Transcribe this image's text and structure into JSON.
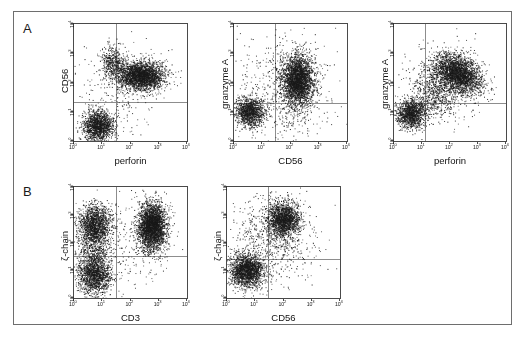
{
  "figure": {
    "panel_letters": [
      "A",
      "B"
    ],
    "tick_labels": [
      "10",
      "10",
      "10",
      "10",
      "10"
    ],
    "tick_exponents": [
      "0",
      "1",
      "2",
      "3",
      "4"
    ],
    "axis_decades": 4,
    "colors": {
      "dot": "#1a1a1a",
      "frame": "#4a4a4a",
      "quadrant": "#8d8d8d",
      "outer_border": "#6e6e6e",
      "background": "#ffffff"
    }
  },
  "chart_data": [
    {
      "type": "scatter",
      "panel": "A1",
      "title": "",
      "xlabel": "perforin",
      "ylabel": "CD56",
      "xlim": [
        0,
        4
      ],
      "ylim": [
        0,
        4
      ],
      "xticks": [
        0,
        1,
        2,
        3,
        4
      ],
      "yticks": [
        0,
        1,
        2,
        3,
        4
      ],
      "grid": false,
      "legend": "none",
      "quadrant_x": 1.5,
      "quadrant_y": 1.35,
      "populations": [
        {
          "name": "CD56+ perforin+ (double positive)",
          "cx": 2.35,
          "cy": 2.25,
          "sx": 0.42,
          "sy": 0.24,
          "n": 2600,
          "rot": 0
        },
        {
          "name": "CD56- perforin- (double negative)",
          "cx": 0.85,
          "cy": 0.52,
          "sx": 0.27,
          "sy": 0.27,
          "n": 1500,
          "rot": 0
        },
        {
          "name": "CD56bright perforin-low",
          "cx": 1.35,
          "cy": 2.72,
          "sx": 0.2,
          "sy": 0.27,
          "n": 420,
          "rot": 0
        },
        {
          "name": "scatter background",
          "cx": 1.7,
          "cy": 1.9,
          "sx": 0.75,
          "sy": 0.8,
          "n": 260,
          "rot": 0
        }
      ]
    },
    {
      "type": "scatter",
      "panel": "A2",
      "title": "",
      "xlabel": "CD56",
      "ylabel": "granzyme A",
      "xlim": [
        0,
        4
      ],
      "ylim": [
        0,
        4
      ],
      "xticks": [
        0,
        1,
        2,
        3,
        4
      ],
      "yticks": [
        0,
        1,
        2,
        3,
        4
      ],
      "grid": false,
      "legend": "none",
      "quadrant_x": 1.45,
      "quadrant_y": 1.3,
      "populations": [
        {
          "name": "CD56+ granzyme A+",
          "cx": 2.25,
          "cy": 2.1,
          "sx": 0.26,
          "sy": 0.42,
          "n": 2700,
          "rot": 0
        },
        {
          "name": "CD56- granzyme A-",
          "cx": 0.55,
          "cy": 1.0,
          "sx": 0.26,
          "sy": 0.24,
          "n": 1250,
          "rot": 0
        },
        {
          "name": "intermediate spread",
          "cx": 2.0,
          "cy": 1.6,
          "sx": 0.6,
          "sy": 0.8,
          "n": 500,
          "rot": 0
        },
        {
          "name": "low-density background",
          "cx": 1.6,
          "cy": 2.0,
          "sx": 0.9,
          "sy": 0.85,
          "n": 260,
          "rot": 0
        }
      ]
    },
    {
      "type": "scatter",
      "panel": "A3",
      "title": "",
      "xlabel": "perforin",
      "ylabel": "granzyme A",
      "xlim": [
        0,
        4
      ],
      "ylim": [
        0,
        4
      ],
      "xticks": [
        0,
        1,
        2,
        3,
        4
      ],
      "yticks": [
        0,
        1,
        2,
        3,
        4
      ],
      "grid": false,
      "legend": "none",
      "quadrant_x": 1.1,
      "quadrant_y": 1.3,
      "populations": [
        {
          "name": "perforin+ granzyme A+ (correlated)",
          "cx": 2.25,
          "cy": 2.3,
          "sx": 0.45,
          "sy": 0.3,
          "n": 2700,
          "rot": -25
        },
        {
          "name": "perforin- granzyme A-",
          "cx": 0.6,
          "cy": 0.95,
          "sx": 0.26,
          "sy": 0.24,
          "n": 1250,
          "rot": 0
        },
        {
          "name": "diagonal bridge",
          "cx": 1.45,
          "cy": 1.65,
          "sx": 0.45,
          "sy": 0.4,
          "n": 620,
          "rot": -35
        },
        {
          "name": "background",
          "cx": 1.6,
          "cy": 2.0,
          "sx": 0.8,
          "sy": 0.8,
          "n": 220,
          "rot": 0
        }
      ]
    },
    {
      "type": "scatter",
      "panel": "B1",
      "title": "",
      "xlabel": "CD3",
      "ylabel": "ζ-chain",
      "xlim": [
        0,
        4
      ],
      "ylim": [
        0,
        4
      ],
      "xticks": [
        0,
        1,
        2,
        3,
        4
      ],
      "yticks": [
        0,
        1,
        2,
        3,
        4
      ],
      "grid": false,
      "legend": "none",
      "quadrant_x": 1.5,
      "quadrant_y": 1.5,
      "populations": [
        {
          "name": "CD3+ ζ-chain high (T cells)",
          "cx": 2.75,
          "cy": 2.6,
          "sx": 0.25,
          "sy": 0.42,
          "n": 3000,
          "rot": 0
        },
        {
          "name": "CD3- ζ-chain high (NK cells)",
          "cx": 0.72,
          "cy": 2.65,
          "sx": 0.3,
          "sy": 0.35,
          "n": 1500,
          "rot": 0
        },
        {
          "name": "CD3- ζ-chain low",
          "cx": 0.72,
          "cy": 0.85,
          "sx": 0.3,
          "sy": 0.35,
          "n": 1500,
          "rot": 0
        },
        {
          "name": "vertical bridge",
          "cx": 0.72,
          "cy": 1.75,
          "sx": 0.3,
          "sy": 0.5,
          "n": 500,
          "rot": 0
        },
        {
          "name": "background",
          "cx": 1.8,
          "cy": 1.9,
          "sx": 0.85,
          "sy": 0.9,
          "n": 230,
          "rot": 0
        }
      ]
    },
    {
      "type": "scatter",
      "panel": "B2",
      "title": "",
      "xlabel": "CD56",
      "ylabel": "ζ-chain",
      "xlim": [
        0,
        4
      ],
      "ylim": [
        0,
        4
      ],
      "xticks": [
        0,
        1,
        2,
        3,
        4
      ],
      "yticks": [
        0,
        1,
        2,
        3,
        4
      ],
      "grid": false,
      "legend": "none",
      "quadrant_x": 1.45,
      "quadrant_y": 1.4,
      "populations": [
        {
          "name": "CD56+ ζ-chain high",
          "cx": 2.0,
          "cy": 2.85,
          "sx": 0.28,
          "sy": 0.32,
          "n": 1700,
          "rot": 0
        },
        {
          "name": "CD56- ζ-chain low",
          "cx": 0.7,
          "cy": 1.0,
          "sx": 0.3,
          "sy": 0.3,
          "n": 1900,
          "rot": 0
        },
        {
          "name": "sparse spread",
          "cx": 1.5,
          "cy": 2.3,
          "sx": 0.6,
          "sy": 0.7,
          "n": 520,
          "rot": 0
        },
        {
          "name": "background",
          "cx": 1.7,
          "cy": 1.8,
          "sx": 0.9,
          "sy": 0.9,
          "n": 230,
          "rot": 0
        }
      ]
    }
  ],
  "panels_layout": [
    {
      "id": "A1",
      "left": 45,
      "top": 11,
      "plot_w": 115,
      "plot_h": 119
    },
    {
      "id": "A2",
      "left": 205,
      "top": 11,
      "plot_w": 115,
      "plot_h": 119
    },
    {
      "id": "A3",
      "left": 365,
      "top": 11,
      "plot_w": 114,
      "plot_h": 119
    },
    {
      "id": "B1",
      "left": 45,
      "top": 174,
      "plot_w": 115,
      "plot_h": 113
    },
    {
      "id": "B2",
      "left": 198,
      "top": 174,
      "plot_w": 115,
      "plot_h": 113
    }
  ]
}
